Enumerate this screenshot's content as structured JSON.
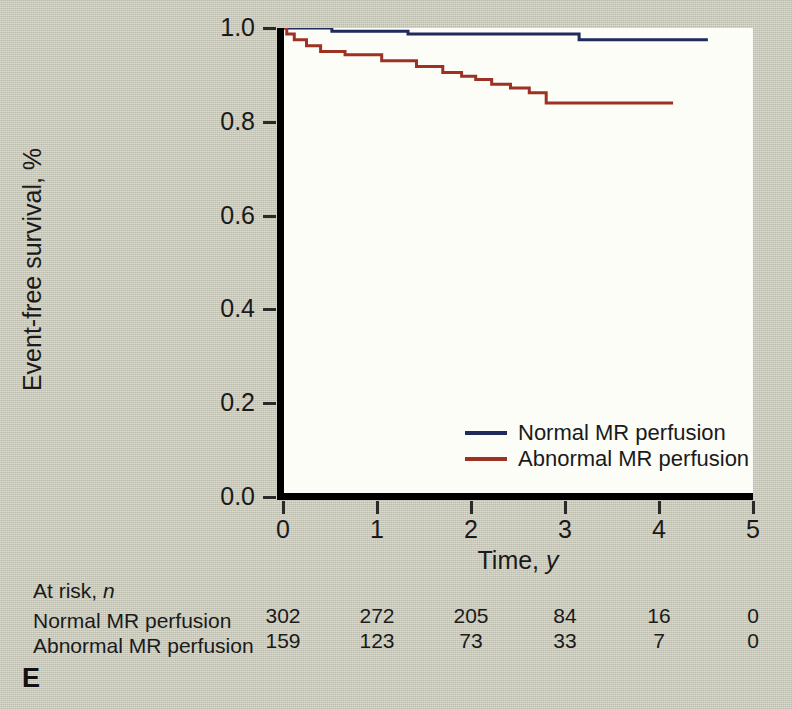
{
  "panel": {
    "label": "E"
  },
  "axes": {
    "y_title": "Event-free survival, %",
    "x_title_main": "Time, ",
    "x_title_italic": "y",
    "y_ticks": [
      "1.0",
      "0.8",
      "0.6",
      "0.4",
      "0.2",
      "0.0"
    ],
    "x_ticks": [
      "0",
      "1",
      "2",
      "3",
      "4",
      "5"
    ]
  },
  "legend": {
    "items": [
      {
        "label": "Normal MR perfusion",
        "color": "#1f2b5c"
      },
      {
        "label": "Abnormal MR perfusion",
        "color": "#9c3124"
      }
    ]
  },
  "at_risk": {
    "title_main": "At risk, ",
    "title_italic": "n",
    "rows": [
      {
        "name": "Normal MR perfusion",
        "values": [
          "302",
          "272",
          "205",
          "84",
          "16",
          "0"
        ]
      },
      {
        "name": "Abnormal MR perfusion",
        "values": [
          "159",
          "123",
          "73",
          "33",
          "7",
          "0"
        ]
      }
    ]
  },
  "chart_data": {
    "type": "line",
    "subtype": "kaplan-meier-step",
    "title": "",
    "xlabel": "Time, y",
    "ylabel": "Event-free survival, %",
    "xlim": [
      0,
      5
    ],
    "ylim": [
      0.0,
      1.0
    ],
    "xticks": [
      0,
      1,
      2,
      3,
      4,
      5
    ],
    "yticks": [
      0.0,
      0.2,
      0.4,
      0.6,
      0.8,
      1.0
    ],
    "grid": false,
    "legend_position": "inside-lower-right",
    "series": [
      {
        "name": "Normal MR perfusion",
        "color": "#1f2b5c",
        "steps": [
          [
            0.0,
            1.0
          ],
          [
            0.52,
            1.0
          ],
          [
            0.52,
            0.993
          ],
          [
            1.33,
            0.993
          ],
          [
            1.33,
            0.987
          ],
          [
            3.15,
            0.987
          ],
          [
            3.15,
            0.975
          ],
          [
            4.52,
            0.975
          ]
        ]
      },
      {
        "name": "Abnormal MR perfusion",
        "color": "#9c3124",
        "steps": [
          [
            0.0,
            1.0
          ],
          [
            0.04,
            1.0
          ],
          [
            0.04,
            0.987
          ],
          [
            0.12,
            0.987
          ],
          [
            0.12,
            0.975
          ],
          [
            0.25,
            0.975
          ],
          [
            0.25,
            0.962
          ],
          [
            0.4,
            0.962
          ],
          [
            0.4,
            0.95
          ],
          [
            0.66,
            0.95
          ],
          [
            0.66,
            0.943
          ],
          [
            1.05,
            0.943
          ],
          [
            1.05,
            0.93
          ],
          [
            1.42,
            0.93
          ],
          [
            1.42,
            0.918
          ],
          [
            1.7,
            0.918
          ],
          [
            1.7,
            0.905
          ],
          [
            1.9,
            0.905
          ],
          [
            1.9,
            0.897
          ],
          [
            2.05,
            0.897
          ],
          [
            2.05,
            0.89
          ],
          [
            2.22,
            0.89
          ],
          [
            2.22,
            0.88
          ],
          [
            2.42,
            0.88
          ],
          [
            2.42,
            0.872
          ],
          [
            2.62,
            0.872
          ],
          [
            2.62,
            0.862
          ],
          [
            2.8,
            0.862
          ],
          [
            2.8,
            0.84
          ],
          [
            4.15,
            0.84
          ]
        ]
      }
    ],
    "at_risk_times": [
      0,
      1,
      2,
      3,
      4,
      5
    ],
    "at_risk_counts": {
      "Normal MR perfusion": [
        302,
        272,
        205,
        84,
        16,
        0
      ],
      "Abnormal MR perfusion": [
        159,
        123,
        73,
        33,
        7,
        0
      ]
    }
  }
}
